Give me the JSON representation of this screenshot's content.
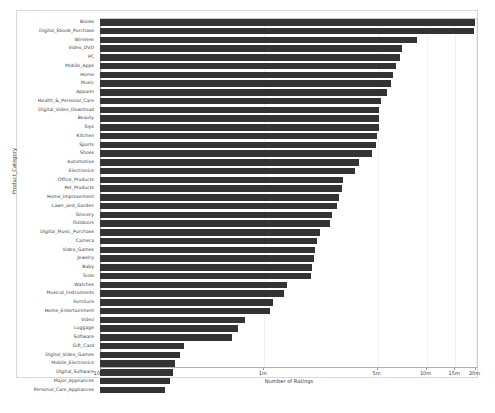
{
  "chart_data": {
    "type": "bar",
    "orientation": "horizontal",
    "title": "",
    "xlabel": "Number of Ratings",
    "ylabel": "Product_Category",
    "xscale": "log",
    "xlim": [
      100000,
      21000000
    ],
    "grid": true,
    "legend": null,
    "bar_color": "#333333",
    "xticks": [
      {
        "label": "100K",
        "value": 100000
      },
      {
        "label": "1m",
        "value": 1000000
      },
      {
        "label": "5m",
        "value": 5000000
      },
      {
        "label": "10m",
        "value": 10000000
      },
      {
        "label": "15m",
        "value": 15000000
      },
      {
        "label": "20m",
        "value": 20000000
      }
    ],
    "categories": [
      "Books",
      "Digital_Ebook_Purchase",
      "Wireless",
      "Video_DVD",
      "PC",
      "Mobile_Apps",
      "Home",
      "Music",
      "Apparel",
      "Health_&_Personal_Care",
      "Digital_Video_Download",
      "Beauty",
      "Toys",
      "Kitchen",
      "Sports",
      "Shoes",
      "Automotive",
      "Electronics",
      "Office_Products",
      "Pet_Products",
      "Home_Improvement",
      "Lawn_and_Garden",
      "Grocery",
      "Outdoors",
      "Digital_Music_Purchase",
      "Camera",
      "Video_Games",
      "Jewelry",
      "Baby",
      "Tools",
      "Watches",
      "Musical_Instruments",
      "Furniture",
      "Home_Entertainment",
      "Video",
      "Luggage",
      "Software",
      "Gift_Card",
      "Digital_Video_Games",
      "Mobile_Electronics",
      "Digital_Software",
      "Major_Appliances",
      "Personal_Care_Appliances"
    ],
    "values": [
      20000000,
      19800000,
      8900000,
      7200000,
      7000000,
      6600000,
      6300000,
      6100000,
      5800000,
      5300000,
      5200000,
      5200000,
      5150000,
      5000000,
      4950000,
      4700000,
      3900000,
      3700000,
      3100000,
      3050000,
      2950000,
      2850000,
      2650000,
      2600000,
      2250000,
      2150000,
      2100000,
      2050000,
      2000000,
      1980000,
      1400000,
      1350000,
      1150000,
      1100000,
      780000,
      700000,
      650000,
      330000,
      310000,
      290000,
      280000,
      270000,
      250000
    ]
  }
}
